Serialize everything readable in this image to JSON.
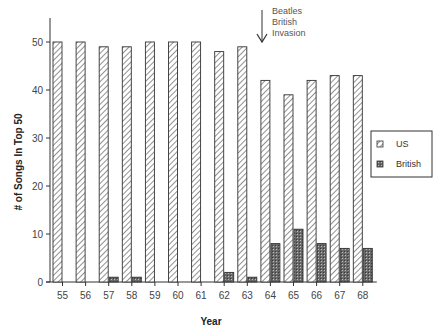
{
  "chart_data": {
    "type": "bar",
    "title": "",
    "xlabel": "Year",
    "ylabel": "# of Songs In Top 50",
    "ylim": [
      0,
      55
    ],
    "yticks": [
      0,
      10,
      20,
      30,
      40,
      50
    ],
    "grid": false,
    "legend_position": "right",
    "categories": [
      "55",
      "56",
      "57",
      "58",
      "59",
      "60",
      "61",
      "62",
      "63",
      "64",
      "65",
      "66",
      "67",
      "68"
    ],
    "series": [
      {
        "name": "US",
        "pattern": "diagonal-hatch",
        "values": [
          50,
          50,
          49,
          49,
          50,
          50,
          50,
          48,
          49,
          42,
          39,
          42,
          43,
          43
        ]
      },
      {
        "name": "British",
        "pattern": "dark-crosshatch",
        "values": [
          0,
          0,
          1,
          1,
          0,
          0,
          0,
          2,
          1,
          8,
          11,
          8,
          7,
          7
        ]
      }
    ],
    "annotations": [
      {
        "text_lines": [
          "Beatles",
          "British",
          "Invasion"
        ],
        "arrow_at_category": "64",
        "arrow": "down"
      }
    ]
  },
  "labels": {
    "xlabel": "Year",
    "ylabel": "# of Songs In Top 50",
    "annotation_lines": [
      "Beatles",
      "British",
      "Invasion"
    ],
    "legend": [
      "US",
      "British"
    ]
  }
}
